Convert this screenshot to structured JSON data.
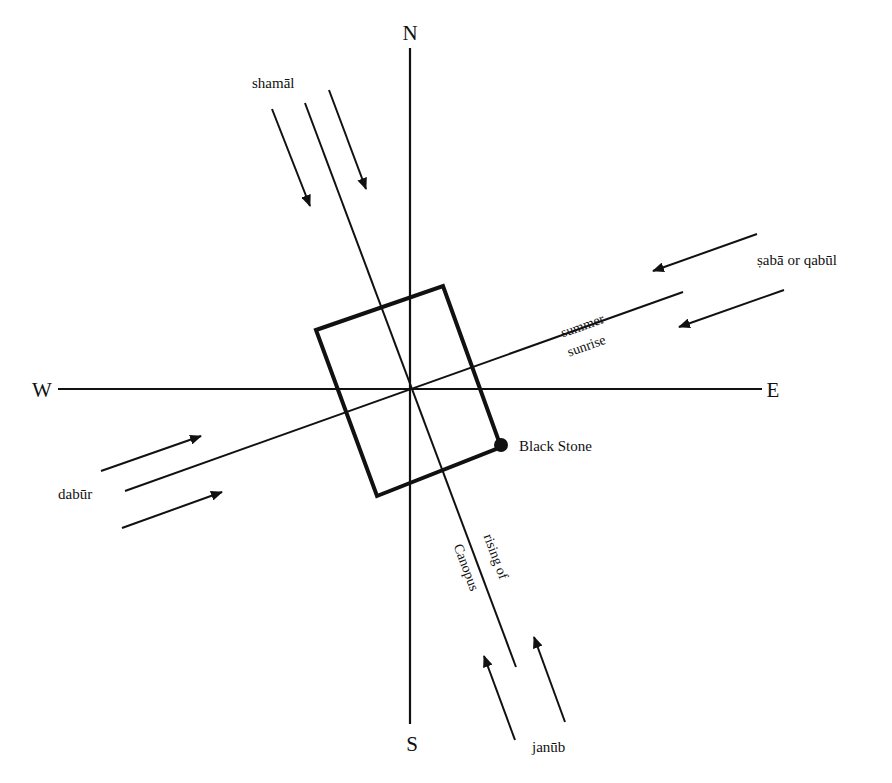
{
  "diagram": {
    "colors": {
      "ink": "#111111",
      "background": "#ffffff"
    },
    "cardinals": {
      "north": "N",
      "south": "S",
      "east": "E",
      "west": "W"
    },
    "winds": {
      "north": "shamāl",
      "east": "ṣabā or qabūl",
      "west": "dabūr",
      "south": "janūb"
    },
    "axes": {
      "major_axis_upper": "rising of",
      "major_axis_lower": "Canopus",
      "minor_axis_upper": "summer",
      "minor_axis_lower": "sunrise"
    },
    "markers": {
      "black_stone": "Black Stone"
    }
  }
}
